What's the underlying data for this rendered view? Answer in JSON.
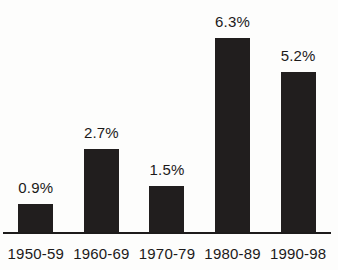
{
  "chart_data": {
    "type": "bar",
    "title": "",
    "xlabel": "",
    "ylabel": "",
    "categories": [
      "1950-59",
      "1960-69",
      "1970-79",
      "1980-89",
      "1990-98"
    ],
    "values": [
      0.9,
      2.7,
      1.5,
      6.3,
      5.2
    ],
    "value_labels": [
      "0.9%",
      "2.7%",
      "1.5%",
      "6.3%",
      "5.2%"
    ],
    "ylim": [
      0,
      6.5
    ],
    "grid": false,
    "legend": "none",
    "bar_color": "#211e1e",
    "axis_line_color": "#1d1b1b",
    "text_color": "#1c1a1a",
    "background_color": "#fdfdfc"
  }
}
